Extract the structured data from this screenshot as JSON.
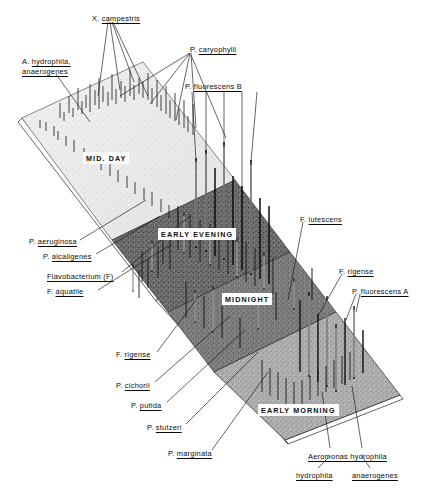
{
  "figure": {
    "type": "3d-surface-landscape",
    "background_color": "#ffffff",
    "ink_color": "#111111"
  },
  "panels": [
    {
      "id": "mid-day",
      "label": "MID. DAY",
      "x": 83,
      "y": 152,
      "shade": "#e8e8e8"
    },
    {
      "id": "early-evening",
      "label": "EARLY EVENING",
      "x": 158,
      "y": 228,
      "shade": "#8d8d8d"
    },
    {
      "id": "midnight",
      "label": "MIDNIGHT",
      "x": 222,
      "y": 293,
      "shade": "#9b9b9b"
    },
    {
      "id": "early-morning",
      "label": "EARLY MORNING",
      "x": 258,
      "y": 404,
      "shade": "#b4b4b4"
    }
  ],
  "annotations": [
    {
      "id": "x-campestris",
      "genus": "X.",
      "species": "campestris",
      "x": 92,
      "y": 14,
      "underline": false
    },
    {
      "id": "a-hydrophila",
      "genus": "A.",
      "species": "hydrophila,",
      "x": 22,
      "y": 57,
      "line2": "anaerogenes",
      "underline": true
    },
    {
      "id": "p-caryophylli",
      "genus": "P.",
      "species": "caryophylli",
      "x": 190,
      "y": 45,
      "underline": true
    },
    {
      "id": "p-fluorescens-b",
      "genus": "P.",
      "species": "fluorescens  B",
      "x": 185,
      "y": 82,
      "underline": true
    },
    {
      "id": "p-aeruginosa",
      "genus": "P.",
      "species": "aeruginosa",
      "x": 29,
      "y": 237,
      "underline": true
    },
    {
      "id": "p-alcaligenes",
      "genus": "P.",
      "species": "alcaligenes",
      "x": 43,
      "y": 252,
      "underline": true
    },
    {
      "id": "flavobacterium-f",
      "genus": "",
      "species": "Flavobacterium (F)",
      "x": 47,
      "y": 272,
      "underline": true
    },
    {
      "id": "f-aquatile",
      "genus": "F.",
      "species": "aquatile",
      "x": 47,
      "y": 287,
      "underline": true
    },
    {
      "id": "f-rigense-left",
      "genus": "F.",
      "species": "rigense",
      "x": 116,
      "y": 350,
      "underline": true
    },
    {
      "id": "p-cichorii",
      "genus": "P.",
      "species": "cichorii",
      "x": 116,
      "y": 381,
      "underline": true
    },
    {
      "id": "p-putida",
      "genus": "P.",
      "species": "putida",
      "x": 131,
      "y": 401,
      "underline": true
    },
    {
      "id": "p-stutzeri",
      "genus": "P.",
      "species": "stutzeri",
      "x": 147,
      "y": 423,
      "underline": true
    },
    {
      "id": "p-marginata",
      "genus": "P.",
      "species": "marginata",
      "x": 168,
      "y": 449,
      "underline": true
    },
    {
      "id": "f-lutescens",
      "genus": "F.",
      "species": "lutescens",
      "x": 300,
      "y": 215,
      "underline": true
    },
    {
      "id": "f-rigense-right",
      "genus": "F.",
      "species": "rigense",
      "x": 339,
      "y": 267,
      "underline": true
    },
    {
      "id": "p-fluorescens-a",
      "genus": "P.",
      "species": "fluorescens  A",
      "x": 352,
      "y": 287,
      "underline": true
    },
    {
      "id": "aeromonas-hydrophila",
      "genus": "",
      "species": "Aeromonas    hydrophila",
      "x": 308,
      "y": 452,
      "underline": true
    },
    {
      "id": "hydrophila",
      "genus": "",
      "species": "hydrophila",
      "x": 296,
      "y": 471,
      "underline": true
    },
    {
      "id": "anaerogenes",
      "genus": "",
      "species": "anaerogenes",
      "x": 352,
      "y": 471,
      "underline": true
    }
  ]
}
